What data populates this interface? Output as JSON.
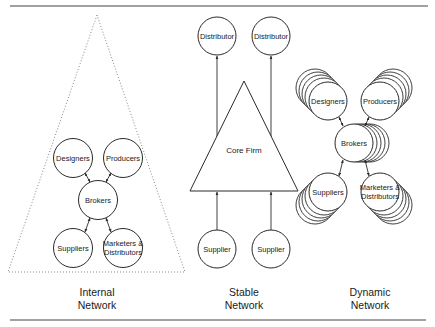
{
  "colors": {
    "stroke": "#2a2a2a",
    "text": "#1a1a1a",
    "background": "#ffffff",
    "rule": "#555555"
  },
  "networks": [
    {
      "id": "internal",
      "caption_line1": "Internal",
      "caption_line2": "Network",
      "boundary": "dotted-triangle",
      "nodes": {
        "designers": "Designers",
        "producers": "Producers",
        "brokers": "Brokers",
        "suppliers": "Suppliers",
        "marketers_line1": "Marketers &",
        "marketers_line2": "Distributors"
      }
    },
    {
      "id": "stable",
      "caption_line1": "Stable",
      "caption_line2": "Network",
      "core": "Core Firm",
      "nodes": {
        "distributor_left": "Distributor",
        "distributor_right": "Distributor",
        "supplier_left": "Supplier",
        "supplier_right": "Supplier"
      }
    },
    {
      "id": "dynamic",
      "caption_line1": "Dynamic",
      "caption_line2": "Network",
      "nodes": {
        "designers": "Designers",
        "producers": "Producers",
        "brokers": "Brokers",
        "suppliers": "Suppliers",
        "marketers_line1": "Marketers &",
        "marketers_line2": "Distributors"
      }
    }
  ]
}
